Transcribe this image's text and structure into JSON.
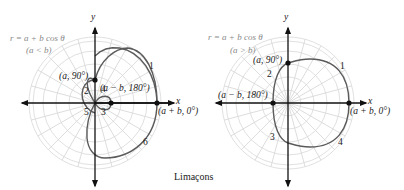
{
  "caption": "Limaçons",
  "colors": {
    "curve": "#5a5a5a",
    "grid": "#d8d8d8",
    "axis": "#111111",
    "equation": "#888888"
  },
  "left": {
    "equation": "r = a + b cos θ",
    "condition": "(a < b)",
    "x_axis": "x",
    "y_axis": "y",
    "points": {
      "p90": "(a, 90°)",
      "p180": "(a − b, 180°)",
      "p0": "(a + b, 0°)"
    },
    "segment_numbers": [
      "1",
      "2",
      "3",
      "4",
      "5",
      "6"
    ]
  },
  "right": {
    "equation": "r = a + b cos θ",
    "condition": "(a > b)",
    "x_axis": "x",
    "y_axis": "y",
    "points": {
      "p90": "(a, 90°)",
      "p180": "(a − b, 180°)",
      "p0": "(a + b, 0°)"
    },
    "segment_numbers": [
      "1",
      "2",
      "3",
      "4"
    ]
  }
}
